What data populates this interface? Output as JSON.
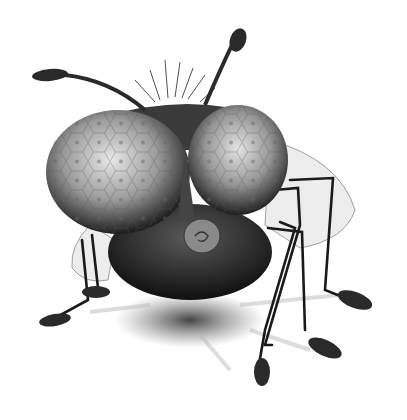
{
  "image": {
    "subject": "cartoon fly illustration",
    "style": "grayscale pencil drawing",
    "background_color": "#ffffff",
    "palette": {
      "dark": "#1a1a1a",
      "mid": "#555555",
      "light": "#d9d9d9",
      "wing": "#cfcfcf"
    },
    "parts": [
      "antennae",
      "bristles",
      "left-eye",
      "right-eye",
      "proboscis",
      "body",
      "wings",
      "legs",
      "feet",
      "shadow"
    ]
  }
}
